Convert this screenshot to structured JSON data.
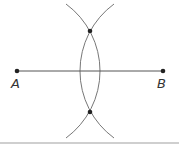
{
  "diagram": {
    "points": [
      {
        "id": "A",
        "label": "A",
        "x": 17,
        "y": 71
      },
      {
        "id": "B",
        "label": "B",
        "x": 163,
        "y": 71
      },
      {
        "id": "P",
        "label": "",
        "x": 90,
        "y": 31
      },
      {
        "id": "Q",
        "label": "",
        "x": 90,
        "y": 112
      }
    ],
    "segment": {
      "from": "A",
      "to": "B"
    },
    "arcs": [
      {
        "center": "A",
        "radius": 83
      },
      {
        "center": "B",
        "radius": 83
      }
    ],
    "colors": {
      "line": "#555555",
      "arc": "#777777",
      "point": "#222222",
      "rule": "#cccccc"
    }
  }
}
